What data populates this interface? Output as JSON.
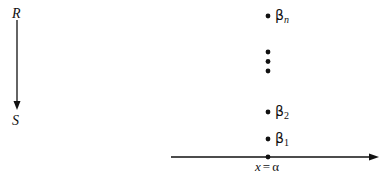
{
  "arrow_left": {
    "top_label": "R",
    "bottom_label": "S"
  },
  "points": [
    {
      "symbol": "β",
      "subscript": "n"
    },
    {
      "symbol": "β",
      "subscript": "2"
    },
    {
      "symbol": "β",
      "subscript": "1"
    }
  ],
  "ellipsis_dots": 3,
  "axis": {
    "label_x": "x",
    "label_eq": "=",
    "label_alpha": "α"
  }
}
